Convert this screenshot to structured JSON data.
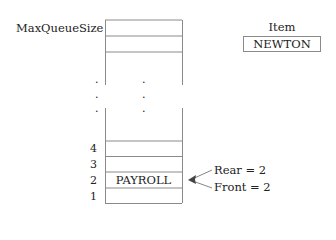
{
  "queue": {
    "max_label": "MaxQueueSize",
    "ellipsis": ".",
    "slots": [
      {
        "index": "4",
        "value": ""
      },
      {
        "index": "3",
        "value": ""
      },
      {
        "index": "2",
        "value": "PAYROLL"
      },
      {
        "index": "1",
        "value": ""
      }
    ]
  },
  "pointers": {
    "rear": "Rear = 2",
    "front": "Front = 2"
  },
  "item": {
    "label": "Item",
    "value": "NEWTON"
  },
  "colors": {
    "line": "#8a8a8a",
    "text": "#222222"
  }
}
